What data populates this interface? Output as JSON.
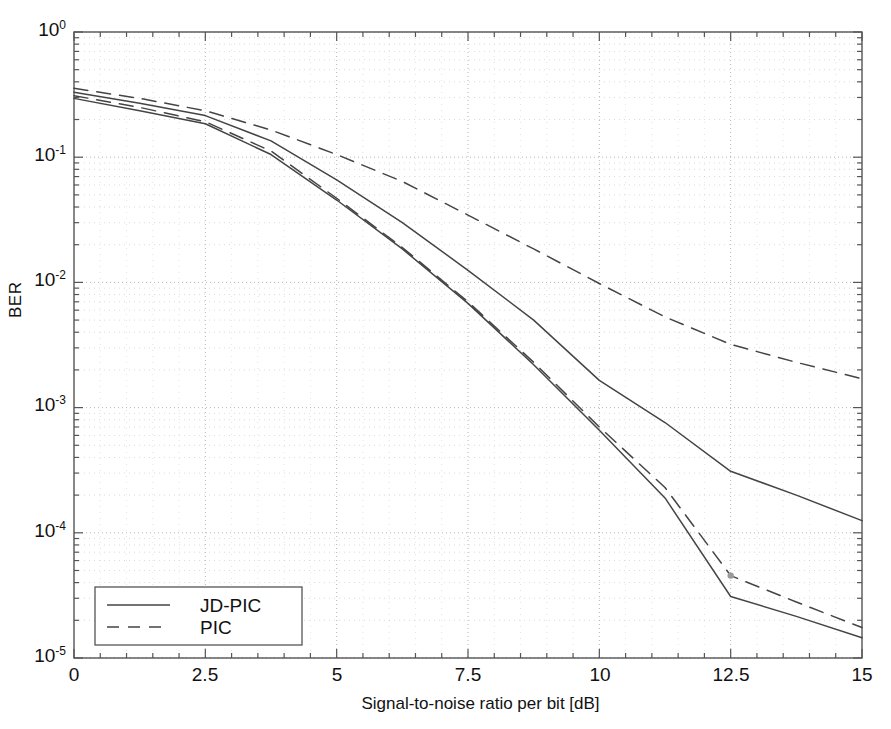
{
  "chart_data": {
    "type": "line",
    "title": "",
    "xlabel": "Signal-to-noise ratio per bit [dB]",
    "ylabel": "BER",
    "xlim": [
      0,
      15
    ],
    "ylim": [
      1e-05,
      1
    ],
    "yscale": "log",
    "grid": true,
    "grid_style": "dotted",
    "xticks": [
      "0",
      "2.5",
      "5",
      "7.5",
      "10",
      "12.5",
      "15"
    ],
    "xtick_values": [
      0,
      2.5,
      5,
      7.5,
      10,
      12.5,
      15
    ],
    "yticks": [
      "10^0",
      "10^-1",
      "10^-2",
      "10^-3",
      "10^-4",
      "10^-5"
    ],
    "ytick_mantissa": "10",
    "ytick_exponents": [
      "0",
      "-1",
      "-2",
      "-3",
      "-4",
      "-5"
    ],
    "legend": {
      "position": "lower left",
      "entries": [
        {
          "label": "JD-PIC",
          "style": "solid"
        },
        {
          "label": "PIC",
          "style": "dashed"
        }
      ]
    },
    "x": [
      0,
      1.25,
      2.5,
      3.75,
      5,
      6.25,
      7.5,
      8.75,
      10,
      11.25,
      12.5,
      13.75,
      15
    ],
    "series": [
      {
        "name": "JD-PIC upper",
        "label": "JD-PIC",
        "style": "solid",
        "color": "#444444",
        "values": [
          0.33,
          0.27,
          0.215,
          0.135,
          0.066,
          0.03,
          0.0125,
          0.005,
          0.00165,
          0.00076,
          0.00031,
          0.0002,
          0.000125
        ]
      },
      {
        "name": "PIC upper",
        "label": "PIC",
        "style": "dashed",
        "color": "#444444",
        "values": [
          0.355,
          0.295,
          0.235,
          0.165,
          0.105,
          0.064,
          0.0345,
          0.0185,
          0.0098,
          0.0053,
          0.0032,
          0.0023,
          0.0017
        ]
      },
      {
        "name": "JD-PIC lower",
        "label": "JD-PIC",
        "style": "solid",
        "color": "#444444",
        "values": [
          0.295,
          0.235,
          0.185,
          0.105,
          0.0455,
          0.0185,
          0.0068,
          0.0022,
          0.00066,
          0.00019,
          3.1e-05,
          2.15e-05,
          1.45e-05
        ]
      },
      {
        "name": "PIC lower",
        "label": "PIC",
        "style": "dashed",
        "color": "#444444",
        "values": [
          0.31,
          0.25,
          0.192,
          0.112,
          0.047,
          0.019,
          0.007,
          0.0023,
          0.0007,
          0.00023,
          4.55e-05,
          2.8e-05,
          1.75e-05
        ]
      }
    ],
    "annotations": [
      {
        "name": "marker-dot",
        "x": 12.5,
        "y": 4.55e-05
      }
    ],
    "colors": {
      "axis": "#555555",
      "grid": "#aaaaaa",
      "line": "#444444",
      "background": "#ffffff"
    }
  }
}
